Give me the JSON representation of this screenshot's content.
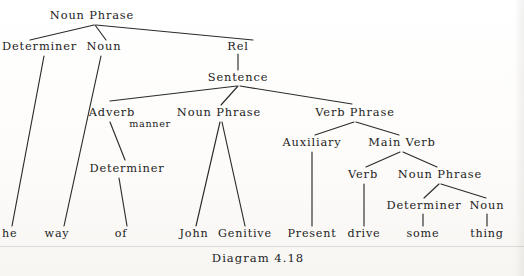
{
  "figure": {
    "caption": "Diagram 4.18",
    "caption_x": 258,
    "caption_y": 259,
    "background_color": "#fdfdfc",
    "ink_color": "#232323"
  },
  "tree": {
    "type": "constituency-parse-tree",
    "nodes": [
      {
        "id": "np-root",
        "label": "Noun Phrase",
        "x": 92,
        "y": 16,
        "kind": "nonterminal",
        "anchor": "center"
      },
      {
        "id": "det-1",
        "label": "Determiner",
        "x": 2,
        "y": 47,
        "kind": "nonterminal",
        "anchor": "left",
        "clipped": true
      },
      {
        "id": "noun-1",
        "label": "Noun",
        "x": 104,
        "y": 47,
        "kind": "nonterminal",
        "anchor": "center"
      },
      {
        "id": "rel",
        "label": "Rel",
        "x": 238,
        "y": 47,
        "kind": "nonterminal",
        "anchor": "center"
      },
      {
        "id": "sentence",
        "label": "Sentence",
        "x": 238,
        "y": 78,
        "kind": "nonterminal",
        "anchor": "center"
      },
      {
        "id": "adverb",
        "label": "Adverb",
        "x": 112,
        "y": 113,
        "kind": "nonterminal",
        "anchor": "center"
      },
      {
        "id": "np-2",
        "label": "Noun Phrase",
        "x": 219,
        "y": 113,
        "kind": "nonterminal",
        "anchor": "center"
      },
      {
        "id": "vp",
        "label": "Verb Phrase",
        "x": 355,
        "y": 113,
        "kind": "nonterminal",
        "anchor": "center"
      },
      {
        "id": "det-2",
        "label": "Determiner",
        "x": 127,
        "y": 169,
        "kind": "nonterminal",
        "anchor": "center"
      },
      {
        "id": "auxiliary",
        "label": "Auxiliary",
        "x": 312,
        "y": 143,
        "kind": "nonterminal",
        "anchor": "center"
      },
      {
        "id": "main-verb",
        "label": "Main Verb",
        "x": 402,
        "y": 143,
        "kind": "nonterminal",
        "anchor": "center"
      },
      {
        "id": "verb",
        "label": "Verb",
        "x": 363,
        "y": 175,
        "kind": "nonterminal",
        "anchor": "center"
      },
      {
        "id": "np-3",
        "label": "Noun Phrase",
        "x": 440,
        "y": 175,
        "kind": "nonterminal",
        "anchor": "center"
      },
      {
        "id": "det-3",
        "label": "Determiner",
        "x": 424,
        "y": 206,
        "kind": "nonterminal",
        "anchor": "center"
      },
      {
        "id": "noun-3",
        "label": "Noun",
        "x": 487,
        "y": 206,
        "kind": "nonterminal",
        "anchor": "center"
      }
    ],
    "subscripts": [
      {
        "id": "adverb-subscript",
        "label": "manner",
        "x": 150,
        "y": 124,
        "parent": "adverb"
      }
    ],
    "leaves": [
      {
        "id": "leaf-the",
        "label": "he",
        "full_word": "the",
        "x": 2,
        "y": 234,
        "anchor": "left",
        "clipped": true
      },
      {
        "id": "leaf-way",
        "label": "way",
        "full_word": "way",
        "x": 57,
        "y": 234,
        "anchor": "center"
      },
      {
        "id": "leaf-of",
        "label": "of",
        "full_word": "of",
        "x": 121,
        "y": 234,
        "anchor": "center"
      },
      {
        "id": "leaf-john",
        "label": "John",
        "full_word": "John",
        "x": 194,
        "y": 234,
        "anchor": "center"
      },
      {
        "id": "leaf-genitive",
        "label": "Genitive",
        "full_word": "Genitive",
        "x": 245,
        "y": 234,
        "anchor": "center"
      },
      {
        "id": "leaf-present",
        "label": "Present",
        "full_word": "Present",
        "x": 312,
        "y": 234,
        "anchor": "center"
      },
      {
        "id": "leaf-drive",
        "label": "drive",
        "full_word": "drive",
        "x": 364,
        "y": 234,
        "anchor": "center"
      },
      {
        "id": "leaf-some",
        "label": "some",
        "full_word": "some",
        "x": 423,
        "y": 234,
        "anchor": "center"
      },
      {
        "id": "leaf-thing",
        "label": "thing",
        "full_word": "thing",
        "x": 487,
        "y": 234,
        "anchor": "center"
      }
    ],
    "edges": [
      {
        "from": "np-root",
        "to": "det-1",
        "x1": 94,
        "y1": 25,
        "x2": 30,
        "y2": 40
      },
      {
        "from": "np-root",
        "to": "noun-1",
        "x1": 95,
        "y1": 25,
        "x2": 106,
        "y2": 40
      },
      {
        "from": "np-root",
        "to": "rel",
        "x1": 96,
        "y1": 25,
        "x2": 253,
        "y2": 40
      },
      {
        "from": "rel",
        "to": "sentence",
        "x1": 238,
        "y1": 54,
        "x2": 238,
        "y2": 70
      },
      {
        "from": "sentence",
        "to": "adverb",
        "x1": 237,
        "y1": 86,
        "x2": 110,
        "y2": 101
      },
      {
        "from": "sentence",
        "to": "np-2",
        "x1": 238,
        "y1": 86,
        "x2": 221,
        "y2": 105
      },
      {
        "from": "sentence",
        "to": "vp",
        "x1": 240,
        "y1": 86,
        "x2": 352,
        "y2": 104
      },
      {
        "from": "det-1",
        "to": "leaf-the",
        "x1": 44,
        "y1": 56,
        "x2": 12,
        "y2": 226
      },
      {
        "from": "noun-1",
        "to": "leaf-way",
        "x1": 101,
        "y1": 56,
        "x2": 64,
        "y2": 226
      },
      {
        "from": "adverb",
        "to": "det-2",
        "x1": 110,
        "y1": 122,
        "x2": 125,
        "y2": 160
      },
      {
        "from": "det-2",
        "to": "leaf-of",
        "x1": 119,
        "y1": 178,
        "x2": 127,
        "y2": 226
      },
      {
        "from": "np-2",
        "to": "leaf-john",
        "x1": 220,
        "y1": 122,
        "x2": 196,
        "y2": 226
      },
      {
        "from": "np-2",
        "to": "leaf-genitive",
        "x1": 222,
        "y1": 122,
        "x2": 245,
        "y2": 226
      },
      {
        "from": "vp",
        "to": "auxiliary",
        "x1": 354,
        "y1": 122,
        "x2": 315,
        "y2": 135
      },
      {
        "from": "vp",
        "to": "main-verb",
        "x1": 356,
        "y1": 122,
        "x2": 399,
        "y2": 135
      },
      {
        "from": "auxiliary",
        "to": "leaf-present",
        "x1": 312,
        "y1": 152,
        "x2": 312,
        "y2": 226
      },
      {
        "from": "main-verb",
        "to": "verb",
        "x1": 400,
        "y1": 152,
        "x2": 366,
        "y2": 167
      },
      {
        "from": "main-verb",
        "to": "np-3",
        "x1": 403,
        "y1": 152,
        "x2": 437,
        "y2": 167
      },
      {
        "from": "verb",
        "to": "leaf-drive",
        "x1": 364,
        "y1": 184,
        "x2": 364,
        "y2": 226
      },
      {
        "from": "np-3",
        "to": "det-3",
        "x1": 439,
        "y1": 184,
        "x2": 424,
        "y2": 198
      },
      {
        "from": "np-3",
        "to": "noun-3",
        "x1": 441,
        "y1": 184,
        "x2": 486,
        "y2": 198
      },
      {
        "from": "det-3",
        "to": "leaf-some",
        "x1": 423,
        "y1": 214,
        "x2": 423,
        "y2": 226
      },
      {
        "from": "noun-3",
        "to": "leaf-thing",
        "x1": 487,
        "y1": 214,
        "x2": 487,
        "y2": 226
      }
    ]
  }
}
